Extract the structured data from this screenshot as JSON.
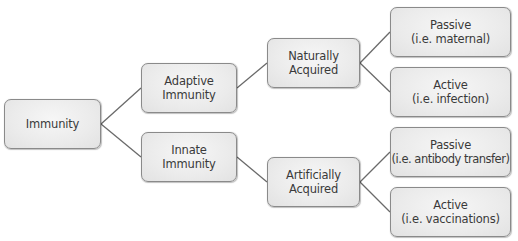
{
  "diagram": {
    "type": "tree",
    "colors": {
      "box_fill": "#ebebeb",
      "box_border": "#8a8a8a",
      "line": "#6a6a6a",
      "text": "#3a3a3a"
    },
    "nodes": {
      "root": {
        "line1": "Immunity"
      },
      "adaptive": {
        "line1": "Adaptive",
        "line2": "Immunity"
      },
      "innate": {
        "line1": "Innate",
        "line2": "Immunity"
      },
      "naturally": {
        "line1": "Naturally",
        "line2": "Acquired"
      },
      "artificially": {
        "line1": "Artificially",
        "line2": "Acquired"
      },
      "passive_maternal": {
        "line1": "Passive",
        "line2": "(i.e. maternal)"
      },
      "active_infection": {
        "line1": "Active",
        "line2": "(i.e. infection)"
      },
      "passive_antibody": {
        "line1": "Passive",
        "line2": "(i.e. antibody transfer)"
      },
      "active_vaccinations": {
        "line1": "Active",
        "line2": "(i.e. vaccinations)"
      }
    },
    "edges": [
      [
        "Immunity",
        "Adaptive Immunity"
      ],
      [
        "Immunity",
        "Innate Immunity"
      ],
      [
        "Adaptive Immunity",
        "Naturally Acquired"
      ],
      [
        "Innate Immunity",
        "Artificially Acquired"
      ],
      [
        "Naturally Acquired",
        "Passive (i.e. maternal)"
      ],
      [
        "Naturally Acquired",
        "Active (i.e. infection)"
      ],
      [
        "Artificially Acquired",
        "Passive (i.e. antibody transfer)"
      ],
      [
        "Artificially Acquired",
        "Active (i.e. vaccinations)"
      ]
    ]
  }
}
